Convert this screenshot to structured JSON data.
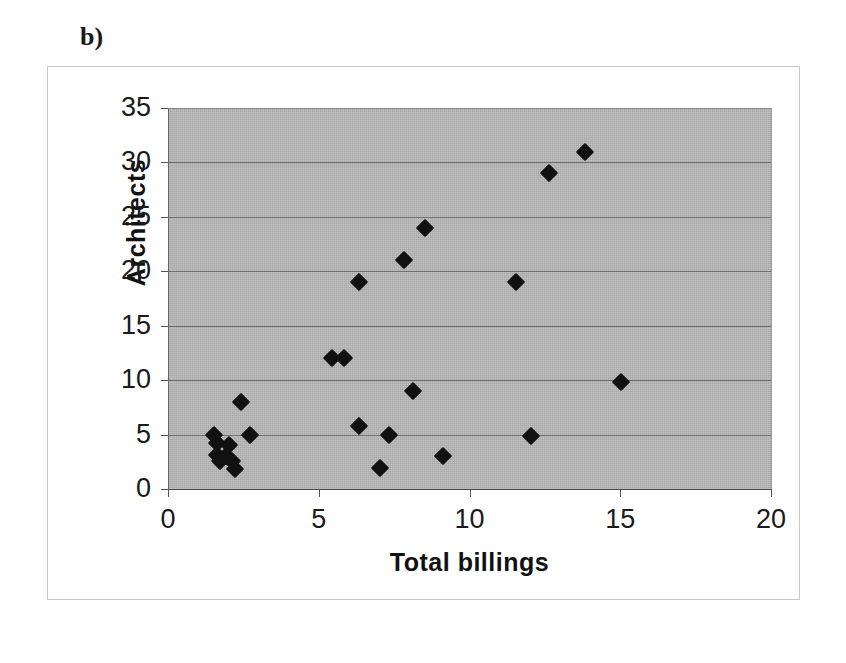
{
  "panel": {
    "label": "b)"
  },
  "chart_data": {
    "type": "scatter",
    "title": "",
    "subtitle": "",
    "xlabel": "Total billings",
    "ylabel": "Architects",
    "xlim": [
      0,
      20
    ],
    "ylim": [
      0,
      35
    ],
    "xticks": [
      "0",
      "5",
      "10",
      "15",
      "20"
    ],
    "xtick_values": [
      0,
      5,
      10,
      15,
      20
    ],
    "yticks": [
      "0",
      "5",
      "10",
      "15",
      "20",
      "25",
      "30",
      "35"
    ],
    "ytick_values": [
      0,
      5,
      10,
      15,
      20,
      25,
      30,
      35
    ],
    "grid": "horizontal",
    "legend": "none",
    "plot_background": "#b4b4b4",
    "marker_color": "#111111",
    "marker_shape": "diamond",
    "series": [
      {
        "name": "Firms",
        "points": [
          [
            1.5,
            5.0
          ],
          [
            1.6,
            4.2
          ],
          [
            1.6,
            3.1
          ],
          [
            1.7,
            2.6
          ],
          [
            1.9,
            3.0
          ],
          [
            2.0,
            4.0
          ],
          [
            2.1,
            2.6
          ],
          [
            2.2,
            1.8
          ],
          [
            2.4,
            8.0
          ],
          [
            2.7,
            5.0
          ],
          [
            5.4,
            12.0
          ],
          [
            5.8,
            12.0
          ],
          [
            6.3,
            19.0
          ],
          [
            6.3,
            5.8
          ],
          [
            7.0,
            1.9
          ],
          [
            7.3,
            5.0
          ],
          [
            7.8,
            21.0
          ],
          [
            8.1,
            9.0
          ],
          [
            8.5,
            24.0
          ],
          [
            9.1,
            3.0
          ],
          [
            11.5,
            19.0
          ],
          [
            12.0,
            4.9
          ],
          [
            12.6,
            29.0
          ],
          [
            13.8,
            31.0
          ],
          [
            15.0,
            9.8
          ]
        ]
      }
    ]
  }
}
